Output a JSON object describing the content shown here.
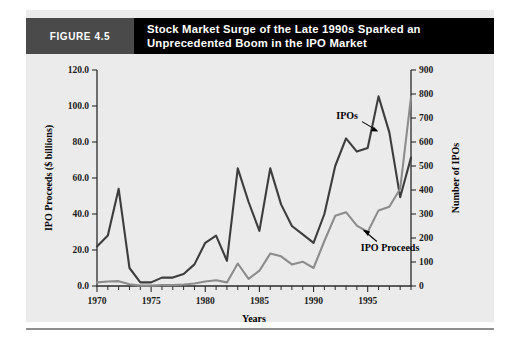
{
  "figure": {
    "number_label": "FIGURE 4.5",
    "title": "Stock Market Surge of the Late 1990s Sparked an Unprecedented Boom in the IPO Market"
  },
  "chart_data": {
    "type": "line",
    "title": "Stock Market Surge of the Late 1990s Sparked an Unprecedented Boom in the IPO Market",
    "xlabel": "Years",
    "ylabel": "IPO Proceeds ($ billions)",
    "y2label": "Number of IPOs",
    "xlim": [
      1970,
      1999
    ],
    "ylim": [
      0,
      120
    ],
    "y2lim": [
      0,
      900
    ],
    "grid": false,
    "legend": "annotations",
    "x": [
      1970,
      1971,
      1972,
      1973,
      1974,
      1975,
      1976,
      1977,
      1978,
      1979,
      1980,
      1981,
      1982,
      1983,
      1984,
      1985,
      1986,
      1987,
      1988,
      1989,
      1990,
      1991,
      1992,
      1993,
      1994,
      1995,
      1996,
      1997,
      1998,
      1999
    ],
    "xticks": [
      1970,
      1975,
      1980,
      1985,
      1990,
      1995
    ],
    "xticklabels": [
      "1970",
      "1975",
      "1980",
      "1985",
      "1990",
      "1995"
    ],
    "yticks": [
      0.0,
      20.0,
      40.0,
      60.0,
      80.0,
      100.0,
      120.0
    ],
    "yticklabels": [
      "0.0",
      "20.0",
      "40.0",
      "60.0",
      "80.0",
      "100.0",
      "120.0"
    ],
    "y2ticks": [
      0,
      100,
      200,
      300,
      400,
      500,
      600,
      700,
      800,
      900
    ],
    "y2ticklabels": [
      "0",
      "100",
      "200",
      "300",
      "400",
      "500",
      "600",
      "700",
      "800",
      "900"
    ],
    "series": [
      {
        "name": "IPOs",
        "axis": "right",
        "units": "count",
        "color": "#3d3d3d",
        "annotation": "IPOs",
        "values": [
          165,
          210,
          405,
          75,
          15,
          15,
          35,
          35,
          50,
          90,
          180,
          210,
          105,
          490,
          350,
          230,
          490,
          340,
          250,
          215,
          180,
          300,
          500,
          615,
          560,
          575,
          790,
          640,
          370,
          535
        ]
      },
      {
        "name": "IPO Proceeds",
        "axis": "left",
        "units": "billions",
        "color": "#8c8c8c",
        "annotation": "IPO Proceeds",
        "values": [
          2.0,
          2.5,
          2.7,
          1.0,
          0.2,
          0.2,
          0.5,
          0.5,
          0.8,
          1.4,
          2.5,
          3.2,
          2.0,
          12.5,
          4.0,
          8.5,
          18.0,
          16.5,
          12.0,
          13.5,
          10.0,
          25.0,
          39.0,
          41.0,
          33.5,
          30.0,
          42.0,
          44.0,
          54.0,
          105.0
        ]
      }
    ],
    "annotations": [
      {
        "text": "IPOs",
        "x": 1993.1,
        "y_left": 93.0
      },
      {
        "text": "IPO Proceeds",
        "x": 1994.0,
        "y_left": 27.5
      }
    ]
  }
}
